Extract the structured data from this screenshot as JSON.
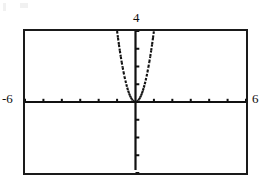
{
  "screen": {
    "type": "graphing-calculator-screen",
    "width": 260,
    "height": 183,
    "background_color": "#ffffff",
    "frame_color": "#1a1a1a",
    "curve_color": "#111111"
  },
  "labels": {
    "y_max": "4",
    "x_min": "-6",
    "x_max": "6"
  },
  "chart_data": {
    "type": "line",
    "title": "",
    "subtitle": "",
    "xlabel": "",
    "ylabel": "",
    "grid": false,
    "legend": null,
    "legend_position": "none",
    "xlim": [
      -6,
      6
    ],
    "ylim": [
      -4,
      4
    ],
    "x_tick_interval": 1,
    "y_tick_interval": 1,
    "x_ticks": [
      -6,
      -5,
      -4,
      -3,
      -2,
      -1,
      0,
      1,
      2,
      3,
      4,
      5,
      6
    ],
    "y_ticks": [
      -4,
      -3,
      -2,
      -1,
      0,
      1,
      2,
      3,
      4
    ],
    "tick_labels_shown": [
      "4",
      "-6",
      "6"
    ],
    "axis_style": "calculator-crosshair",
    "curve_style": "dotted-pixel-trace",
    "series": [
      {
        "name": "y = 4x^2",
        "equation": "y = 4x^2",
        "vertex": [
          0,
          0
        ],
        "opens": "up",
        "x": [
          -1.0,
          -0.95,
          -0.9,
          -0.85,
          -0.8,
          -0.75,
          -0.7,
          -0.65,
          -0.6,
          -0.55,
          -0.5,
          -0.45,
          -0.4,
          -0.35,
          -0.3,
          -0.25,
          -0.2,
          -0.15,
          -0.1,
          -0.05,
          0.0,
          0.05,
          0.1,
          0.15,
          0.2,
          0.25,
          0.3,
          0.35,
          0.4,
          0.45,
          0.5,
          0.55,
          0.6,
          0.65,
          0.7,
          0.75,
          0.8,
          0.85,
          0.9,
          0.95,
          1.0
        ],
        "values": [
          4.0,
          3.61,
          3.24,
          2.89,
          2.56,
          2.25,
          1.96,
          1.69,
          1.44,
          1.21,
          1.0,
          0.81,
          0.64,
          0.49,
          0.36,
          0.25,
          0.16,
          0.09,
          0.04,
          0.01,
          0.0,
          0.01,
          0.04,
          0.09,
          0.16,
          0.25,
          0.36,
          0.49,
          0.64,
          0.81,
          1.0,
          1.21,
          1.44,
          1.69,
          1.96,
          2.25,
          2.56,
          2.89,
          3.24,
          3.61,
          4.0
        ]
      }
    ]
  }
}
